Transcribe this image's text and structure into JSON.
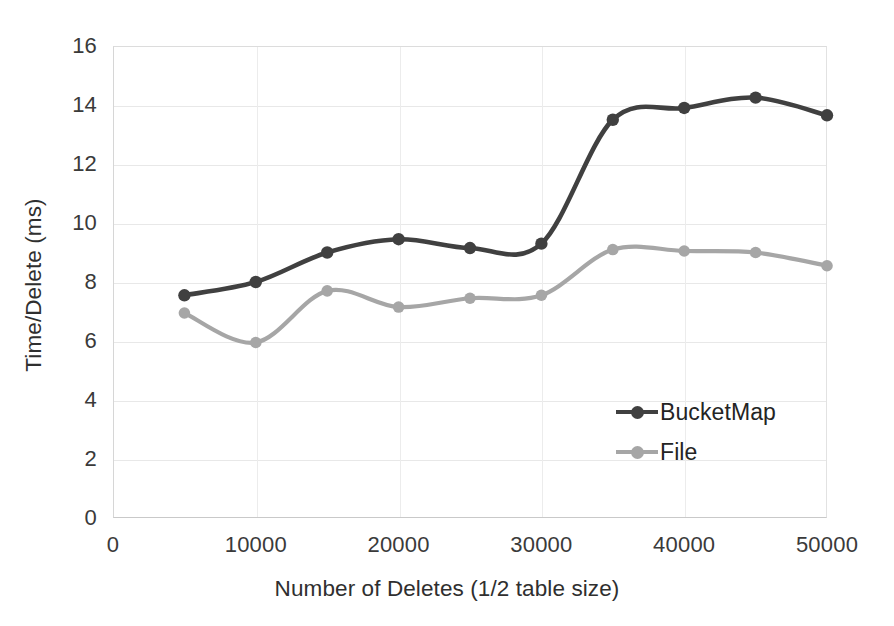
{
  "chart_data": {
    "type": "line",
    "title": "",
    "xlabel": "Number of Deletes (1/2 table size)",
    "ylabel": "Time/Delete (ms)",
    "x": [
      5000,
      10000,
      15000,
      20000,
      25000,
      30000,
      35000,
      40000,
      45000,
      50000
    ],
    "xlim": [
      0,
      50000
    ],
    "ylim": [
      0,
      16
    ],
    "xticks": [
      "0",
      "10000",
      "20000",
      "30000",
      "40000",
      "50000"
    ],
    "xtick_values": [
      0,
      10000,
      20000,
      30000,
      40000,
      50000
    ],
    "yticks": [
      "0",
      "2",
      "4",
      "6",
      "8",
      "10",
      "12",
      "14",
      "16"
    ],
    "ytick_values": [
      0,
      2,
      4,
      6,
      8,
      10,
      12,
      14,
      16
    ],
    "grid": true,
    "legend_position": "inside-right",
    "series": [
      {
        "name": "BucketMap",
        "color": "#404040",
        "marker": "circle",
        "values": [
          7.55,
          8.0,
          9.0,
          9.45,
          9.15,
          9.3,
          13.5,
          13.9,
          14.25,
          13.65
        ]
      },
      {
        "name": "File",
        "color": "#a6a6a6",
        "marker": "circle",
        "values": [
          6.95,
          5.95,
          7.7,
          7.15,
          7.45,
          7.55,
          9.1,
          9.05,
          9.0,
          8.55
        ]
      }
    ]
  },
  "legend": {
    "items": [
      {
        "label": "BucketMap"
      },
      {
        "label": "File"
      }
    ]
  },
  "colors": {
    "bucketmap": "#404040",
    "file": "#a6a6a6",
    "grid": "#e8e8e8",
    "text": "#2f2f2f",
    "background": "#ffffff"
  }
}
